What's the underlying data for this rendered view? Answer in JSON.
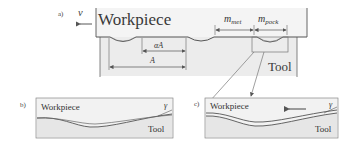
{
  "panels": {
    "a": {
      "label": "a)",
      "velocity_symbol": "v",
      "workpiece_label": "Workpiece",
      "tool_label": "Tool",
      "dimensions": {
        "alpha_A": "αA",
        "A": "A",
        "m_met_main": "m",
        "m_met_sub": "met",
        "m_pock_main": "m",
        "m_pock_sub": "pock"
      }
    },
    "b": {
      "label": "b)",
      "workpiece_label": "Workpiece",
      "tool_label": "Tool",
      "angle_symbol": "γ"
    },
    "c": {
      "label": "c)",
      "workpiece_label": "Workpiece",
      "tool_label": "Tool",
      "angle_symbol": "γ"
    }
  },
  "colors": {
    "line": "#555555",
    "tool_fill": "#ececec",
    "panel_fill": "#f0f0f0"
  }
}
